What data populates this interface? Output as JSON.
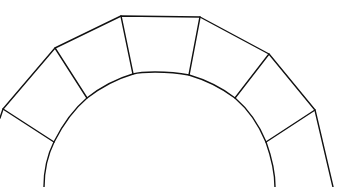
{
  "diagram": {
    "type": "arch-voussoirs",
    "colors": {
      "background": "#ffffff",
      "stroke": "#111111"
    },
    "outer_extrados": [
      [
        0,
        118
      ],
      [
        3,
        109
      ],
      [
        55,
        48
      ],
      [
        121,
        16
      ],
      [
        200,
        17
      ],
      [
        269,
        54
      ],
      [
        315,
        110
      ],
      [
        333,
        187
      ]
    ],
    "inner_intrados_path": "M44,187 C44,170 47,156 54,142 C63,124 74,109 87,98 C101,87 116,79 133,74 C140,72 148,72 155,72 C167,72 179,73 189,75 C206,80 222,88 235,98 C249,110 259,125 266,142 C271,156 275,171 275,187",
    "joints": [
      {
        "id": "joint-1",
        "outer": [
          3,
          109
        ],
        "inner": [
          54,
          142
        ]
      },
      {
        "id": "joint-2",
        "outer": [
          55,
          48
        ],
        "inner": [
          87,
          98
        ]
      },
      {
        "id": "joint-3",
        "outer": [
          121,
          16
        ],
        "inner": [
          133,
          74
        ]
      },
      {
        "id": "joint-4",
        "outer": [
          200,
          17
        ],
        "inner": [
          189,
          75
        ]
      },
      {
        "id": "joint-5",
        "outer": [
          269,
          54
        ],
        "inner": [
          235,
          98
        ]
      },
      {
        "id": "joint-6",
        "outer": [
          315,
          110
        ],
        "inner": [
          266,
          142
        ]
      }
    ],
    "voussoir_count": 7
  }
}
